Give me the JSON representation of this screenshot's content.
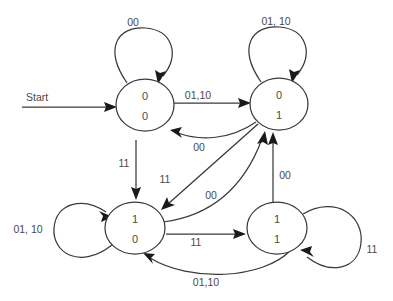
{
  "diagram": {
    "start_label": "Start",
    "background_color": "#ffffff",
    "line_color": "#3a3a3a",
    "text_color": "#4a4a4a"
  },
  "states": [
    {
      "id": "S00",
      "top_bit": "0",
      "bottom_bit": "0",
      "cx": 145,
      "cy": 105,
      "rx": 29,
      "ry": 26
    },
    {
      "id": "S01",
      "top_bit": "0",
      "bottom_bit": "1",
      "cx": 279,
      "cy": 104,
      "rx": 29,
      "ry": 26
    },
    {
      "id": "S10",
      "top_bit": "1",
      "bottom_bit": "0",
      "cx": 135,
      "cy": 228,
      "rx": 30,
      "ry": 26
    },
    {
      "id": "S11",
      "top_bit": "1",
      "bottom_bit": "1",
      "cx": 277,
      "cy": 228,
      "rx": 30,
      "ry": 26
    }
  ],
  "transitions": [
    {
      "id": "T1",
      "from": "S00",
      "to": "S00",
      "label": "00",
      "kind": "self-loop-top"
    },
    {
      "id": "T2",
      "from": "S01",
      "to": "S01",
      "label": "01, 10",
      "kind": "self-loop-top"
    },
    {
      "id": "T3",
      "from": "S10",
      "to": "S10",
      "label": "01, 10",
      "kind": "self-loop-left"
    },
    {
      "id": "T4",
      "from": "S11",
      "to": "S11",
      "label": "11",
      "kind": "self-loop-right"
    },
    {
      "id": "T5",
      "from": "S00",
      "to": "S01",
      "label": "01,10",
      "kind": "straight"
    },
    {
      "id": "T6",
      "from": "S01",
      "to": "S00",
      "label": "00",
      "kind": "curve"
    },
    {
      "id": "T7",
      "from": "S00",
      "to": "S10",
      "label": "11",
      "kind": "straight-vertical"
    },
    {
      "id": "T8",
      "from": "S01",
      "to": "S10",
      "label": "11",
      "kind": "diagonal"
    },
    {
      "id": "T9",
      "from": "S10",
      "to": "S01",
      "label": "00",
      "kind": "curve"
    },
    {
      "id": "T10",
      "from": "S11",
      "to": "S01",
      "label": "00",
      "kind": "straight-vertical"
    },
    {
      "id": "T11",
      "from": "S10",
      "to": "S11",
      "label": "11",
      "kind": "straight"
    },
    {
      "id": "T12",
      "from": "S11",
      "to": "S10",
      "label": "01,10",
      "kind": "curve-bottom"
    }
  ],
  "labels": {
    "start": "Start",
    "loop_s00": "00",
    "loop_s01": "01, 10",
    "loop_s10": "01, 10",
    "loop_s11": "11",
    "s00_to_s01": "01,10",
    "s01_to_s00": "00",
    "s00_to_s10": "11",
    "s01_to_s10": "11",
    "s10_to_s01": "00",
    "s11_to_s01": "00",
    "s10_to_s11": "11",
    "s11_to_s10": "01,10"
  },
  "state_text": {
    "s00_top": "0",
    "s00_bottom": "0",
    "s01_top": "0",
    "s01_bottom": "1",
    "s10_top": "1",
    "s10_bottom": "0",
    "s11_top": "1",
    "s11_bottom": "1"
  }
}
